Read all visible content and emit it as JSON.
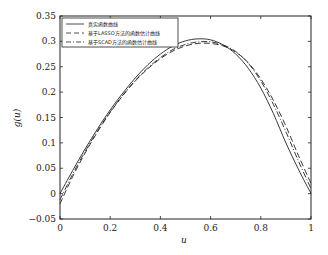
{
  "chart_data": {
    "type": "line",
    "title": "",
    "xlabel": "u",
    "ylabel": "g(u)",
    "xlim": [
      0,
      1
    ],
    "ylim": [
      -0.05,
      0.35
    ],
    "xticks": [
      "0",
      "0.2",
      "0.4",
      "0.6",
      "0.8",
      "1"
    ],
    "yticks": [
      "-0.05",
      "0",
      "0.05",
      "0.1",
      "0.15",
      "0.2",
      "0.25",
      "0.3",
      "0.35"
    ],
    "grid": false,
    "legend_position": "upper left",
    "x": [
      0,
      0.05,
      0.1,
      0.15,
      0.2,
      0.25,
      0.3,
      0.35,
      0.4,
      0.45,
      0.5,
      0.55,
      0.6,
      0.65,
      0.7,
      0.75,
      0.8,
      0.85,
      0.9,
      0.95,
      1.0
    ],
    "series": [
      {
        "name": "真实函数曲线",
        "style": "solid",
        "values": [
          0.0,
          0.045,
          0.088,
          0.128,
          0.165,
          0.198,
          0.228,
          0.254,
          0.275,
          0.291,
          0.301,
          0.305,
          0.303,
          0.293,
          0.275,
          0.247,
          0.208,
          0.158,
          0.1,
          0.048,
          0.0
        ]
      },
      {
        "name": "基于LASSO方法的函数估计曲线",
        "style": "dashed",
        "values": [
          -0.02,
          0.033,
          0.08,
          0.122,
          0.16,
          0.193,
          0.222,
          0.246,
          0.266,
          0.281,
          0.291,
          0.296,
          0.296,
          0.291,
          0.279,
          0.258,
          0.226,
          0.184,
          0.133,
          0.075,
          0.02
        ]
      },
      {
        "name": "基于SCAD方法的函数估计曲线",
        "style": "dashdot",
        "values": [
          -0.012,
          0.038,
          0.083,
          0.124,
          0.161,
          0.194,
          0.223,
          0.248,
          0.268,
          0.284,
          0.294,
          0.299,
          0.299,
          0.293,
          0.28,
          0.257,
          0.222,
          0.176,
          0.122,
          0.064,
          0.01
        ]
      }
    ]
  },
  "legend": {
    "items": [
      {
        "label": "真实函数曲线"
      },
      {
        "label": "基于LASSO方法的函数估计曲线"
      },
      {
        "label": "基于SCAD方法的函数估计曲线"
      }
    ]
  },
  "axes": {
    "xlabel": "u",
    "ylabel": "g(u)"
  }
}
